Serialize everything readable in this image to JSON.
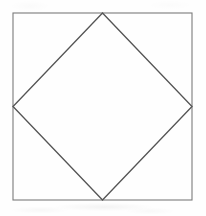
{
  "figure": {
    "canvas": {
      "width": 206,
      "height": 216,
      "background_color": "#fefefe"
    },
    "shapes": [
      {
        "name": "outer-square",
        "type": "rect",
        "stroke_color": "#7a7a7a",
        "stroke_width": 1.1,
        "fill": "none",
        "x": 13,
        "y": 13,
        "width": 179,
        "height": 187,
        "corners": [
          {
            "label": "top-left",
            "x": 13,
            "y": 13
          },
          {
            "label": "top-right",
            "x": 192,
            "y": 13
          },
          {
            "label": "bottom-right",
            "x": 192,
            "y": 200
          },
          {
            "label": "bottom-left",
            "x": 13,
            "y": 200
          }
        ]
      },
      {
        "name": "inscribed-diamond",
        "type": "polygon",
        "stroke_color": "#555555",
        "stroke_width": 1.35,
        "fill": "none",
        "points": "102.5,13 192,106.5 102.5,200 13,106.5",
        "vertices": [
          {
            "label": "top-apex",
            "x": 102.5,
            "y": 13
          },
          {
            "label": "right-vertex",
            "x": 192,
            "y": 106.5
          },
          {
            "label": "bottom-apex",
            "x": 102.5,
            "y": 200
          },
          {
            "label": "left-vertex",
            "x": 13,
            "y": 106.5
          }
        ]
      }
    ]
  }
}
